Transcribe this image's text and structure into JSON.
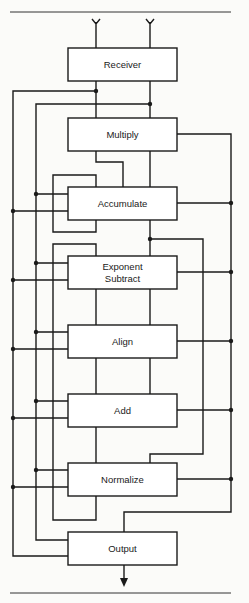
{
  "diagram": {
    "type": "block-diagram",
    "stages": [
      {
        "id": "receiver",
        "label": "Receiver"
      },
      {
        "id": "multiply",
        "label": "Multiply"
      },
      {
        "id": "accumulate",
        "label": "Accumulate"
      },
      {
        "id": "exponent-subtract",
        "label_line1": "Exponent",
        "label_line2": "Subtract"
      },
      {
        "id": "align",
        "label": "Align"
      },
      {
        "id": "add",
        "label": "Add"
      },
      {
        "id": "normalize",
        "label": "Normalize"
      },
      {
        "id": "output",
        "label": "Output"
      }
    ],
    "inputs": [
      "antenna-1",
      "antenna-2"
    ],
    "output_arrow": "down",
    "colors": {
      "line": "#1a1a1a",
      "background": "#fbfbf9",
      "box_fill": "#ffffff"
    }
  }
}
